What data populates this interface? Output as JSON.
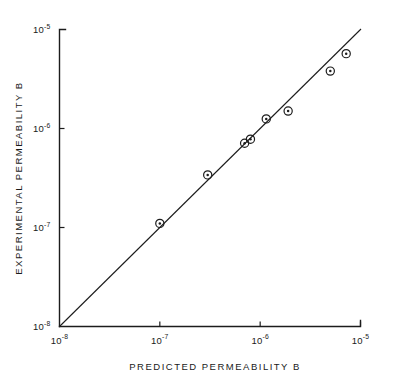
{
  "chart_data": {
    "type": "scatter",
    "title": "",
    "xlabel": "PREDICTED  PERMEABILITY  B",
    "ylabel": "EXPERIMENTAL  PERMEABILITY  B",
    "xscale": "log",
    "yscale": "log",
    "xlim": [
      1e-08,
      1e-05
    ],
    "ylim": [
      1e-08,
      1e-05
    ],
    "grid": false,
    "legend": false,
    "x_ticks": [
      {
        "value": 1e-08,
        "mantissa": "10",
        "exponent": "-8"
      },
      {
        "value": 1e-07,
        "mantissa": "10",
        "exponent": "-7"
      },
      {
        "value": 1e-06,
        "mantissa": "10",
        "exponent": "-6"
      },
      {
        "value": 1e-05,
        "mantissa": "10",
        "exponent": "-5"
      }
    ],
    "y_ticks": [
      {
        "value": 1e-08,
        "mantissa": "10",
        "exponent": "-8"
      },
      {
        "value": 1e-07,
        "mantissa": "10",
        "exponent": "-7"
      },
      {
        "value": 1e-06,
        "mantissa": "10",
        "exponent": "-6"
      },
      {
        "value": 1e-05,
        "mantissa": "10",
        "exponent": "-5"
      }
    ],
    "series": [
      {
        "name": "data",
        "marker": "circle-with-center-dot",
        "color": "#1c1c1c",
        "points": [
          {
            "x": 1e-07,
            "y": 1.1e-07
          },
          {
            "x": 3e-07,
            "y": 3.4e-07
          },
          {
            "x": 7e-07,
            "y": 7.1e-07
          },
          {
            "x": 8e-07,
            "y": 7.8e-07
          },
          {
            "x": 1.15e-06,
            "y": 1.25e-06
          },
          {
            "x": 1.9e-06,
            "y": 1.5e-06
          },
          {
            "x": 5e-06,
            "y": 3.8e-06
          },
          {
            "x": 7.2e-06,
            "y": 5.7e-06
          }
        ]
      }
    ],
    "reference_line": {
      "name": "parity-line",
      "description": "one-to-one line",
      "from": {
        "x": 1e-08,
        "y": 1e-08
      },
      "to": {
        "x": 1.2e-05,
        "y": 1.2e-05
      },
      "color": "#1c1c1c"
    }
  },
  "figure": {
    "axis_color": "#1c1c1c",
    "background": "#ffffff"
  }
}
